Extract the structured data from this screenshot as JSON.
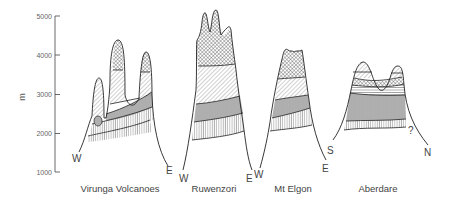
{
  "figure": {
    "type": "altitudinal vegetation zonation profiles",
    "y_axis": {
      "label": "m",
      "ticks": [
        "5000",
        "4000",
        "3000",
        "2000",
        "1000"
      ],
      "range": [
        1000,
        5000
      ]
    },
    "mountains": [
      {
        "name": "Virunga Volcanoes",
        "left_dir": "W",
        "right_dir": "E"
      },
      {
        "name": "Ruwenzori",
        "left_dir": "W",
        "right_dir": "E"
      },
      {
        "name": "Mt Elgon",
        "left_dir": "W",
        "right_dir": "E"
      },
      {
        "name": "Aberdare",
        "left_dir": "S",
        "right_dir": "N",
        "annotation": "?"
      }
    ],
    "zone_patterns": [
      {
        "pattern": "vertical-hatch",
        "meaning": "lower montane zone"
      },
      {
        "pattern": "grey-vertical-hatch",
        "meaning": "bamboo / mid zone"
      },
      {
        "pattern": "diagonal-hatch",
        "meaning": "ericaceous zone"
      },
      {
        "pattern": "cross-hatch",
        "meaning": "afroalpine zone"
      }
    ]
  }
}
